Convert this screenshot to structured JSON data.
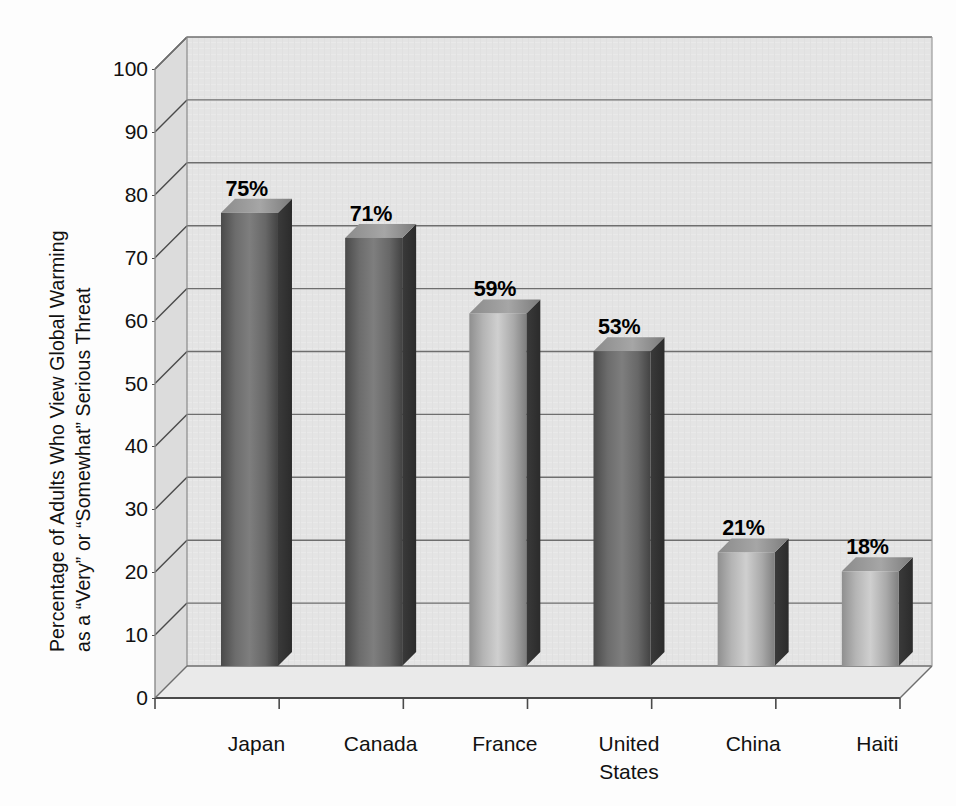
{
  "chart_data": {
    "type": "bar",
    "title": "",
    "subtitle": "",
    "xlabel": "",
    "ylabel": "Percentage of Adults Who View Global Warming as a \"Very\" or \"Somewhat\" Serious Threat",
    "ylabel_lines": [
      "Percentage of Adults Who View Global Warming",
      "as a “Very” or “Somewhat” Serious Threat"
    ],
    "categories": [
      "Japan",
      "Canada",
      "France",
      "United States",
      "China",
      "Haiti"
    ],
    "category_lines": [
      [
        "Japan"
      ],
      [
        "Canada"
      ],
      [
        "France"
      ],
      [
        "United",
        "States"
      ],
      [
        "China"
      ],
      [
        "Haiti"
      ]
    ],
    "values": [
      75,
      71,
      59,
      53,
      21,
      18
    ],
    "data_labels": [
      "75%",
      "71%",
      "59%",
      "53%",
      "21%",
      "18%"
    ],
    "ylim": [
      0,
      100
    ],
    "ytick_values": [
      0,
      10,
      20,
      30,
      40,
      50,
      60,
      70,
      80,
      90,
      100
    ],
    "ytick_labels": [
      "0",
      "10",
      "20",
      "30",
      "40",
      "50",
      "60",
      "70",
      "80",
      "90",
      "100"
    ],
    "ytick_interval": 10,
    "grid": true,
    "grid_axis": "y",
    "legend": false,
    "legend_position": "none",
    "style": "3d-column",
    "colors": {
      "plot_background": "#e4e4e4",
      "wall_left": "#dcdcdc",
      "floor": "#e9e9e9",
      "gridline": "#6e6e6e",
      "axis_line": "#4a4a4a",
      "bar_front_light": "#b9b9b9",
      "bar_front_dark": "#5c5c5c",
      "bar_side": "#3b3b3b",
      "bar_top": "#8e8e8e",
      "text": "#111111"
    }
  }
}
